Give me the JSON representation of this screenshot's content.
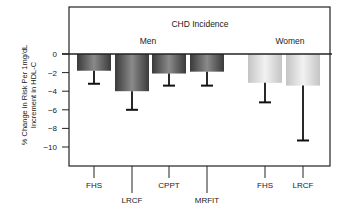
{
  "chart_data": {
    "type": "bar",
    "title": "CHD Incidence",
    "xlabel": "",
    "ylabel": "% Change in Risk Per 1mg/dL Increment in HDL-C",
    "ylabel_lines": [
      "% Change in Risk Per 1mg/dL",
      "Increment in HDL-C"
    ],
    "ylim": [
      -11.8,
      5.1
    ],
    "yticks": [
      0,
      -2,
      -4,
      -6,
      -8,
      -10
    ],
    "ytick_labels": [
      "0",
      "−2",
      "−4",
      "−6",
      "−8",
      "−10"
    ],
    "grid": false,
    "groups": [
      {
        "label": "Men",
        "categories": [
          "FHS",
          "LRCF",
          "CPPT",
          "MRFIT"
        ],
        "color": "#555555"
      },
      {
        "label": "Women",
        "categories": [
          "FHS",
          "LRCF"
        ],
        "color": "#d0d0d0"
      }
    ],
    "categories": [
      "FHS",
      "LRCF",
      "CPPT",
      "MRFIT",
      "FHS",
      "LRCF"
    ],
    "series": [
      {
        "name": "Men",
        "values": [
          -1.8,
          -4.0,
          -2.1,
          -1.9,
          null,
          null
        ],
        "error_low": [
          -3.2,
          -6.0,
          -3.4,
          -3.4,
          null,
          null
        ]
      },
      {
        "name": "Women",
        "values": [
          null,
          null,
          null,
          null,
          -3.1,
          -3.4
        ],
        "error_low": [
          null,
          null,
          null,
          null,
          -5.2,
          -9.3
        ]
      }
    ]
  },
  "labels": {
    "title": "CHD Incidence",
    "men": "Men",
    "women": "Women",
    "ylabel_line1": "% Change in Risk Per 1mg/dL",
    "ylabel_line2": "Increment in HDL-C"
  }
}
